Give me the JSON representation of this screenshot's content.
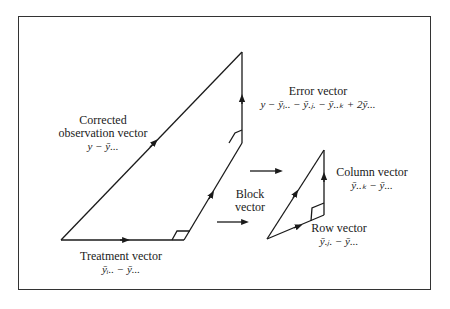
{
  "figure": {
    "labels": {
      "corrected": {
        "title_line1": "Corrected",
        "title_line2": "observation vector",
        "formula": "y − ȳ..."
      },
      "error": {
        "title": "Error vector",
        "formula": "y − ȳᵢ.. − ȳ.ⱼ. − ȳ..ₖ + 2ȳ..."
      },
      "treatment": {
        "title": "Treatment vector",
        "formula": "ȳᵢ.. − ȳ..."
      },
      "block": {
        "title_line1": "Block",
        "title_line2": "vector"
      },
      "column": {
        "title": "Column vector",
        "formula": "ȳ..ₖ − ȳ..."
      },
      "row": {
        "title": "Row vector",
        "formula": "ȳ.ⱼ. − ȳ..."
      }
    },
    "colors": {
      "stroke": "#1a1a1a",
      "background": "#ffffff",
      "frame": "#333333"
    }
  }
}
